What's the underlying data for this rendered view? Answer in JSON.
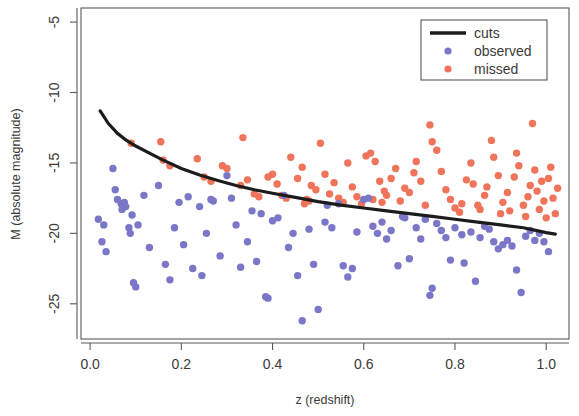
{
  "chart_data": {
    "type": "scatter",
    "title": "",
    "xlabel": "z (redshift)",
    "ylabel": "M (absolute magnitude)",
    "xlim": [
      -0.02,
      1.05
    ],
    "ylim": [
      -27.5,
      -4.0
    ],
    "xticks": [
      0.0,
      0.2,
      0.4,
      0.6,
      0.8,
      1.0
    ],
    "xtick_labels": [
      "0.0",
      "0.2",
      "0.4",
      "0.6",
      "0.8",
      "1.0"
    ],
    "yticks": [
      -5,
      -10,
      -15,
      -20,
      -25
    ],
    "ytick_labels": [
      "-5",
      "-10",
      "-15",
      "-20",
      "-25"
    ],
    "grid": false,
    "legend_position": "top-right",
    "legend": [
      {
        "label": "cuts",
        "marker": "line",
        "color": "#1c1c1c"
      },
      {
        "label": "observed",
        "marker": "circle",
        "color": "#7b77c8"
      },
      {
        "label": "missed",
        "marker": "circle",
        "color": "#f0745a"
      }
    ],
    "series": [
      {
        "name": "cuts",
        "type": "line",
        "color": "#1c1c1c",
        "x": [
          0.022,
          0.04,
          0.06,
          0.08,
          0.1,
          0.13,
          0.16,
          0.2,
          0.24,
          0.28,
          0.32,
          0.36,
          0.4,
          0.45,
          0.5,
          0.55,
          0.6,
          0.65,
          0.7,
          0.75,
          0.8,
          0.85,
          0.9,
          0.95,
          1.0,
          1.02
        ],
        "y": [
          -11.3,
          -12.2,
          -12.9,
          -13.4,
          -13.8,
          -14.3,
          -14.8,
          -15.4,
          -15.85,
          -16.25,
          -16.6,
          -16.9,
          -17.15,
          -17.45,
          -17.75,
          -18.0,
          -18.2,
          -18.4,
          -18.6,
          -18.8,
          -19.0,
          -19.2,
          -19.4,
          -19.6,
          -19.95,
          -20.05
        ]
      },
      {
        "name": "observed",
        "type": "scatter",
        "color": "#7b77c8",
        "points": [
          [
            0.018,
            -19.0
          ],
          [
            0.026,
            -20.6
          ],
          [
            0.03,
            -19.4
          ],
          [
            0.035,
            -21.3
          ],
          [
            0.05,
            -15.4
          ],
          [
            0.055,
            -16.9
          ],
          [
            0.06,
            -17.6
          ],
          [
            0.068,
            -17.9
          ],
          [
            0.07,
            -18.3
          ],
          [
            0.075,
            -17.8
          ],
          [
            0.078,
            -18.1
          ],
          [
            0.085,
            -19.6
          ],
          [
            0.088,
            -20.0
          ],
          [
            0.092,
            -18.7
          ],
          [
            0.095,
            -23.5
          ],
          [
            0.1,
            -23.8
          ],
          [
            0.105,
            -19.4
          ],
          [
            0.118,
            -17.3
          ],
          [
            0.13,
            -21.0
          ],
          [
            0.15,
            -16.6
          ],
          [
            0.165,
            -22.2
          ],
          [
            0.175,
            -23.3
          ],
          [
            0.185,
            -19.6
          ],
          [
            0.195,
            -17.8
          ],
          [
            0.205,
            -20.8
          ],
          [
            0.215,
            -17.4
          ],
          [
            0.225,
            -22.5
          ],
          [
            0.24,
            -18.1
          ],
          [
            0.245,
            -23.0
          ],
          [
            0.255,
            -20.0
          ],
          [
            0.265,
            -17.6
          ],
          [
            0.27,
            -17.7
          ],
          [
            0.285,
            -21.6
          ],
          [
            0.3,
            -15.9
          ],
          [
            0.31,
            -17.5
          ],
          [
            0.32,
            -19.4
          ],
          [
            0.33,
            -22.4
          ],
          [
            0.345,
            -20.6
          ],
          [
            0.355,
            -18.4
          ],
          [
            0.365,
            -22.0
          ],
          [
            0.375,
            -18.6
          ],
          [
            0.385,
            -24.5
          ],
          [
            0.39,
            -24.6
          ],
          [
            0.4,
            -19.1
          ],
          [
            0.412,
            -18.9
          ],
          [
            0.425,
            -17.3
          ],
          [
            0.435,
            -21.0
          ],
          [
            0.445,
            -20.0
          ],
          [
            0.455,
            -23.0
          ],
          [
            0.465,
            -26.2
          ],
          [
            0.48,
            -19.7
          ],
          [
            0.49,
            -22.2
          ],
          [
            0.5,
            -25.4
          ],
          [
            0.515,
            -19.2
          ],
          [
            0.52,
            -18.0
          ],
          [
            0.53,
            -19.6
          ],
          [
            0.545,
            -17.9
          ],
          [
            0.555,
            -22.3
          ],
          [
            0.565,
            -23.1
          ],
          [
            0.575,
            -22.5
          ],
          [
            0.585,
            -19.9
          ],
          [
            0.6,
            -17.6
          ],
          [
            0.61,
            -17.5
          ],
          [
            0.62,
            -19.5
          ],
          [
            0.63,
            -20.0
          ],
          [
            0.64,
            -19.2
          ],
          [
            0.65,
            -20.4
          ],
          [
            0.66,
            -19.8
          ],
          [
            0.675,
            -22.3
          ],
          [
            0.685,
            -18.8
          ],
          [
            0.69,
            -18.9
          ],
          [
            0.7,
            -21.8
          ],
          [
            0.715,
            -19.6
          ],
          [
            0.725,
            -20.4
          ],
          [
            0.735,
            -19.0
          ],
          [
            0.745,
            -24.4
          ],
          [
            0.75,
            -23.9
          ],
          [
            0.76,
            -19.3
          ],
          [
            0.77,
            -19.8
          ],
          [
            0.78,
            -20.3
          ],
          [
            0.79,
            -21.9
          ],
          [
            0.8,
            -19.6
          ],
          [
            0.815,
            -20.1
          ],
          [
            0.82,
            -22.1
          ],
          [
            0.835,
            -19.9
          ],
          [
            0.845,
            -23.4
          ],
          [
            0.855,
            -20.3
          ],
          [
            0.865,
            -19.5
          ],
          [
            0.875,
            -19.7
          ],
          [
            0.885,
            -20.6
          ],
          [
            0.895,
            -21.1
          ],
          [
            0.905,
            -20.8
          ],
          [
            0.915,
            -20.5
          ],
          [
            0.925,
            -20.9
          ],
          [
            0.935,
            -22.6
          ],
          [
            0.945,
            -24.2
          ],
          [
            0.955,
            -20.2
          ],
          [
            0.965,
            -19.8
          ],
          [
            0.975,
            -20.5
          ],
          [
            0.985,
            -20.0
          ],
          [
            0.995,
            -20.6
          ],
          [
            1.005,
            -21.3
          ]
        ]
      },
      {
        "name": "missed",
        "type": "scatter",
        "color": "#f0745a",
        "points": [
          [
            0.09,
            -13.6
          ],
          [
            0.155,
            -13.5
          ],
          [
            0.16,
            -14.8
          ],
          [
            0.175,
            -15.2
          ],
          [
            0.235,
            -14.7
          ],
          [
            0.25,
            -16.0
          ],
          [
            0.265,
            -16.3
          ],
          [
            0.29,
            -15.2
          ],
          [
            0.3,
            -15.4
          ],
          [
            0.33,
            -16.6
          ],
          [
            0.335,
            -13.2
          ],
          [
            0.345,
            -16.2
          ],
          [
            0.36,
            -17.2
          ],
          [
            0.37,
            -17.4
          ],
          [
            0.39,
            -16.0
          ],
          [
            0.4,
            -15.8
          ],
          [
            0.41,
            -16.5
          ],
          [
            0.42,
            -17.3
          ],
          [
            0.43,
            -17.5
          ],
          [
            0.44,
            -14.6
          ],
          [
            0.455,
            -16.1
          ],
          [
            0.465,
            -15.3
          ],
          [
            0.475,
            -17.6
          ],
          [
            0.485,
            -16.6
          ],
          [
            0.495,
            -16.9
          ],
          [
            0.505,
            -13.6
          ],
          [
            0.515,
            -15.8
          ],
          [
            0.525,
            -17.2
          ],
          [
            0.535,
            -16.4
          ],
          [
            0.545,
            -17.5
          ],
          [
            0.555,
            -17.8
          ],
          [
            0.565,
            -15.0
          ],
          [
            0.575,
            -16.7
          ],
          [
            0.585,
            -17.4
          ],
          [
            0.595,
            -17.9
          ],
          [
            0.605,
            -14.5
          ],
          [
            0.615,
            -14.3
          ],
          [
            0.625,
            -14.9
          ],
          [
            0.635,
            -16.3
          ],
          [
            0.645,
            -17.0
          ],
          [
            0.65,
            -17.3
          ],
          [
            0.66,
            -16.1
          ],
          [
            0.67,
            -15.4
          ],
          [
            0.68,
            -17.7
          ],
          [
            0.69,
            -16.8
          ],
          [
            0.7,
            -17.1
          ],
          [
            0.71,
            -15.7
          ],
          [
            0.715,
            -14.9
          ],
          [
            0.725,
            -16.3
          ],
          [
            0.735,
            -18.0
          ],
          [
            0.745,
            -12.3
          ],
          [
            0.75,
            -13.5
          ],
          [
            0.76,
            -14.1
          ],
          [
            0.77,
            -15.6
          ],
          [
            0.78,
            -16.9
          ],
          [
            0.79,
            -17.6
          ],
          [
            0.8,
            -18.2
          ],
          [
            0.81,
            -18.5
          ],
          [
            0.815,
            -17.9
          ],
          [
            0.825,
            -16.2
          ],
          [
            0.835,
            -15.0
          ],
          [
            0.84,
            -16.5
          ],
          [
            0.85,
            -18.0
          ],
          [
            0.855,
            -18.3
          ],
          [
            0.865,
            -17.3
          ],
          [
            0.87,
            -16.7
          ],
          [
            0.88,
            -13.4
          ],
          [
            0.885,
            -14.6
          ],
          [
            0.895,
            -15.9
          ],
          [
            0.9,
            -18.6
          ],
          [
            0.905,
            -17.8
          ],
          [
            0.915,
            -17.1
          ],
          [
            0.92,
            -18.4
          ],
          [
            0.93,
            -16.0
          ],
          [
            0.935,
            -14.3
          ],
          [
            0.94,
            -15.2
          ],
          [
            0.95,
            -18.0
          ],
          [
            0.955,
            -18.8
          ],
          [
            0.96,
            -17.4
          ],
          [
            0.965,
            -16.6
          ],
          [
            0.97,
            -12.2
          ],
          [
            0.975,
            -15.5
          ],
          [
            0.98,
            -17.0
          ],
          [
            0.985,
            -18.3
          ],
          [
            0.99,
            -16.3
          ],
          [
            0.995,
            -17.7
          ],
          [
            1.0,
            -18.9
          ],
          [
            1.005,
            -16.1
          ],
          [
            1.01,
            -15.3
          ],
          [
            1.015,
            -17.5
          ],
          [
            1.02,
            -18.6
          ],
          [
            1.025,
            -16.8
          ],
          [
            0.47,
            -17.9
          ],
          [
            0.48,
            -17.7
          ],
          [
            0.62,
            -17.6
          ],
          [
            0.64,
            -17.8
          ]
        ]
      }
    ]
  }
}
